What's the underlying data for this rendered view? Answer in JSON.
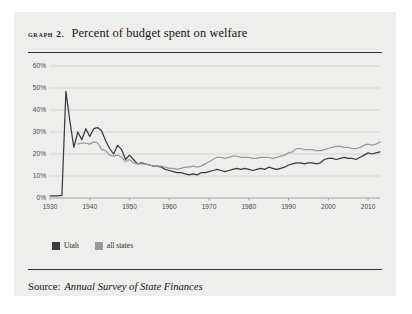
{
  "figure": {
    "label": "Graph 2.",
    "title": "Percent of budget spent on welfare",
    "source_prefix": "Source:",
    "source_title": "Annual Survey of State Finances",
    "panel_color": "#eeeeec",
    "rule_color": "#2e2e2e"
  },
  "legend": {
    "position": "below-plot-left",
    "entries": [
      {
        "label": "Utah",
        "color": "#3b3b3b"
      },
      {
        "label": "all states",
        "color": "#9a9a9a"
      }
    ]
  },
  "chart_data": {
    "type": "line",
    "title": "Percent of budget spent on welfare",
    "xlabel": "",
    "ylabel": "",
    "xlim": [
      1930,
      2013
    ],
    "ylim": [
      0,
      60
    ],
    "grid": true,
    "y_ticks": [
      0,
      10,
      20,
      30,
      40,
      50,
      60
    ],
    "y_tick_labels": [
      "0%",
      "10%",
      "20%",
      "30%",
      "40%",
      "50%",
      "60%"
    ],
    "x_ticks": [
      1930,
      1940,
      1950,
      1960,
      1970,
      1980,
      1990,
      2000,
      2010
    ],
    "x_tick_labels": [
      "1930",
      "1940",
      "1950",
      "1960",
      "1970",
      "1980",
      "1990",
      "2000",
      "2010"
    ],
    "legend_position": "below",
    "series": [
      {
        "name": "Utah",
        "color": "#3b3b3b",
        "x": [
          1930,
          1931,
          1932,
          1933,
          1934,
          1935,
          1936,
          1937,
          1938,
          1939,
          1940,
          1941,
          1942,
          1943,
          1944,
          1945,
          1946,
          1947,
          1948,
          1949,
          1950,
          1951,
          1952,
          1953,
          1954,
          1955,
          1956,
          1957,
          1958,
          1959,
          1960,
          1961,
          1962,
          1963,
          1964,
          1965,
          1966,
          1967,
          1968,
          1969,
          1970,
          1971,
          1972,
          1973,
          1974,
          1975,
          1976,
          1977,
          1978,
          1979,
          1980,
          1981,
          1982,
          1983,
          1984,
          1985,
          1986,
          1987,
          1988,
          1989,
          1990,
          1991,
          1992,
          1993,
          1994,
          1995,
          1996,
          1997,
          1998,
          1999,
          2000,
          2001,
          2002,
          2003,
          2004,
          2005,
          2006,
          2007,
          2008,
          2009,
          2010,
          2011,
          2012,
          2013
        ],
        "values": [
          1.0,
          1.0,
          1.0,
          1.2,
          48.5,
          35.0,
          23.0,
          30.0,
          26.5,
          31.5,
          28.0,
          31.5,
          32.0,
          30.5,
          26.0,
          22.5,
          20.0,
          24.0,
          22.0,
          17.5,
          19.5,
          17.5,
          15.5,
          16.0,
          15.5,
          15.0,
          14.5,
          14.5,
          14.0,
          13.0,
          12.5,
          12.0,
          11.5,
          11.5,
          11.0,
          10.5,
          11.0,
          10.5,
          11.5,
          11.5,
          12.0,
          12.5,
          13.0,
          12.5,
          12.0,
          12.5,
          13.0,
          13.5,
          13.0,
          13.5,
          13.0,
          12.5,
          13.0,
          13.5,
          13.0,
          14.0,
          13.5,
          13.0,
          13.5,
          14.0,
          15.0,
          15.5,
          16.0,
          16.0,
          15.5,
          16.0,
          16.0,
          15.5,
          16.0,
          17.5,
          18.0,
          18.0,
          17.5,
          18.0,
          18.5,
          18.0,
          18.0,
          17.5,
          18.5,
          19.5,
          20.5,
          20.0,
          20.5,
          21.0
        ]
      },
      {
        "name": "all states",
        "color": "#9a9a9a",
        "x": [
          1937,
          1938,
          1939,
          1940,
          1941,
          1942,
          1943,
          1944,
          1945,
          1946,
          1947,
          1948,
          1949,
          1950,
          1951,
          1952,
          1953,
          1954,
          1955,
          1956,
          1957,
          1958,
          1959,
          1960,
          1961,
          1962,
          1963,
          1964,
          1965,
          1966,
          1967,
          1968,
          1969,
          1970,
          1971,
          1972,
          1973,
          1974,
          1975,
          1976,
          1977,
          1978,
          1979,
          1980,
          1981,
          1982,
          1983,
          1984,
          1985,
          1986,
          1987,
          1988,
          1989,
          1990,
          1991,
          1992,
          1993,
          1994,
          1995,
          1996,
          1997,
          1998,
          1999,
          2000,
          2001,
          2002,
          2003,
          2004,
          2005,
          2006,
          2007,
          2008,
          2009,
          2010,
          2011,
          2012,
          2013
        ],
        "values": [
          24.5,
          25.0,
          25.0,
          24.5,
          25.5,
          25.0,
          22.0,
          21.5,
          19.5,
          19.0,
          19.5,
          18.5,
          16.5,
          17.5,
          16.0,
          15.5,
          15.5,
          15.5,
          15.0,
          14.5,
          14.5,
          14.5,
          14.0,
          13.5,
          13.5,
          13.0,
          13.5,
          14.0,
          14.0,
          14.5,
          14.0,
          14.5,
          15.5,
          16.5,
          17.5,
          18.5,
          18.5,
          18.0,
          18.5,
          19.0,
          19.0,
          18.5,
          18.5,
          18.5,
          18.0,
          18.0,
          18.5,
          18.5,
          18.5,
          18.0,
          18.5,
          19.0,
          19.5,
          20.5,
          21.0,
          22.5,
          22.5,
          22.0,
          22.0,
          22.0,
          21.5,
          21.5,
          22.0,
          22.5,
          23.0,
          23.5,
          23.5,
          23.0,
          23.0,
          22.5,
          22.5,
          23.0,
          24.0,
          24.5,
          24.0,
          24.5,
          25.5
        ]
      }
    ]
  }
}
